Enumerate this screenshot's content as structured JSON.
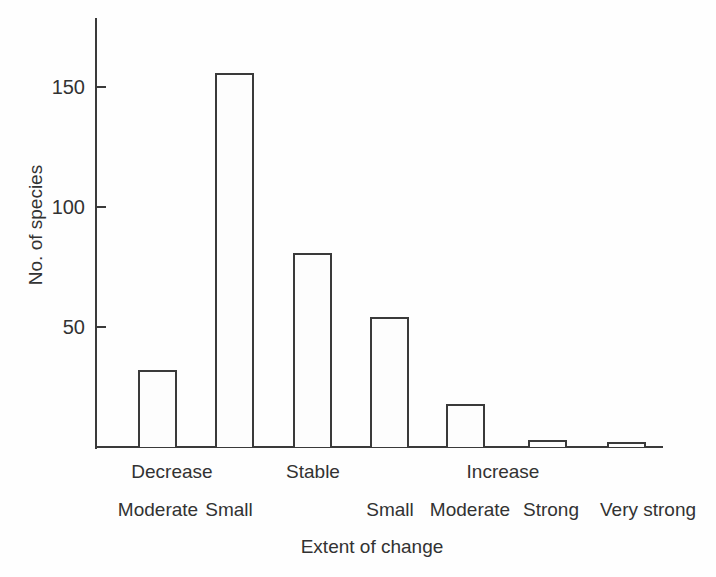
{
  "figure": {
    "background": "#fefefe",
    "ink_color": "#3a3a3a",
    "text_color": "#323232"
  },
  "chart_data": {
    "type": "bar",
    "title": "",
    "xlabel": "Extent of change",
    "ylabel": "No. of species",
    "ylim": [
      0,
      178
    ],
    "yticks": [
      50,
      100,
      150
    ],
    "grid": false,
    "legend_position": "none",
    "bar_fill": "#fdfdfd",
    "bar_outline": "#3a3a3a",
    "categories": [
      "Moderate",
      "Small",
      "Stable",
      "Small",
      "Moderate",
      "Strong",
      "Very strong"
    ],
    "values": [
      32,
      156,
      81,
      54,
      18,
      3,
      2
    ],
    "series": [
      {
        "name": "No. of species",
        "values": [
          32,
          156,
          81,
          54,
          18,
          3,
          2
        ]
      }
    ],
    "group_labels": [
      {
        "label": "Decrease",
        "bars": [
          0,
          1
        ]
      },
      {
        "label": "Stable",
        "bars": [
          2
        ]
      },
      {
        "label": "Increase",
        "bars": [
          3,
          4,
          5,
          6
        ]
      }
    ],
    "sub_labels": [
      "Moderate",
      "Small",
      "",
      "Small",
      "Moderate",
      "Strong",
      "Very strong"
    ]
  }
}
